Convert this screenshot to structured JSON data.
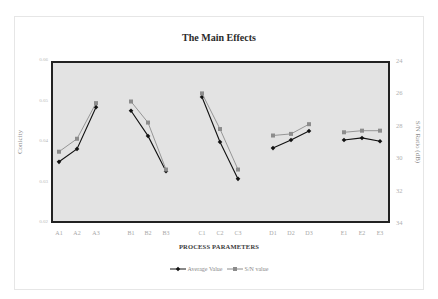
{
  "chart_data": {
    "type": "line",
    "title": "The Main Effects",
    "xlabel": "PROCESS PARAMETERS",
    "ylabel": "Conicity",
    "y2label": "S/N Ratio (dB)",
    "categories": [
      "A1",
      "A2",
      "A3",
      "B1",
      "B2",
      "B3",
      "C1",
      "C2",
      "C3",
      "D1",
      "D2",
      "D3",
      "E1",
      "E2",
      "E3"
    ],
    "groups": [
      {
        "name": "A",
        "levels": [
          "A1",
          "A2",
          "A3"
        ]
      },
      {
        "name": "B",
        "levels": [
          "B1",
          "B2",
          "B3"
        ]
      },
      {
        "name": "C",
        "levels": [
          "C1",
          "C2",
          "C3"
        ]
      },
      {
        "name": "D",
        "levels": [
          "D1",
          "D2",
          "D3"
        ]
      },
      {
        "name": "E",
        "levels": [
          "E1",
          "E2",
          "E3"
        ]
      }
    ],
    "ylim": [
      0.02,
      0.06
    ],
    "yticks": [
      "0.06",
      "0.05",
      "0.04",
      "0.03",
      "0.02"
    ],
    "y2lim": [
      24,
      34
    ],
    "y2_inverted": true,
    "y2ticks": [
      "24",
      "26",
      "28",
      "30",
      "32",
      "34"
    ],
    "series": [
      {
        "name": "Average Value",
        "axis": "left",
        "marker": "diamond",
        "color": "#111111",
        "values": [
          0.0351,
          0.0383,
          0.0486,
          0.0477,
          0.0415,
          0.0328,
          0.0511,
          0.04,
          0.0309,
          0.0385,
          0.0405,
          0.0427,
          0.0405,
          0.041,
          0.0402
        ]
      },
      {
        "name": "S/N value",
        "axis": "right",
        "marker": "square",
        "color": "#8c8c8c",
        "values": [
          29.6,
          28.8,
          26.6,
          26.5,
          27.8,
          30.7,
          26.0,
          28.2,
          30.7,
          28.6,
          28.5,
          27.9,
          28.4,
          28.3,
          28.3
        ]
      }
    ],
    "grid": false,
    "legend_position": "bottom"
  },
  "xtick_positions": [
    59,
    77,
    96,
    131,
    148,
    166,
    202,
    220,
    238,
    273,
    291,
    309,
    344,
    362,
    380
  ],
  "legend": {
    "avg_label": "Average Value",
    "sn_label": "S/N value"
  }
}
